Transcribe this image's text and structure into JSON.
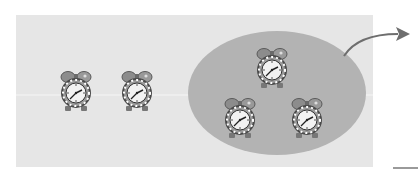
{
  "diagram": {
    "colors": {
      "panel": "#e6e6e6",
      "ellipse": "#b3b3b3",
      "arrow": "#6e6e6e",
      "clock_bell": "#8c8c8c",
      "clock_ring": "#555555",
      "clock_face": "#f2f2f2"
    },
    "clocks": [
      {
        "id": "clock-1",
        "group": "outside",
        "x": 59,
        "y": 70
      },
      {
        "id": "clock-2",
        "group": "outside",
        "x": 120,
        "y": 70
      },
      {
        "id": "clock-3",
        "group": "ellipse",
        "x": 255,
        "y": 47
      },
      {
        "id": "clock-4",
        "group": "ellipse",
        "x": 223,
        "y": 97
      },
      {
        "id": "clock-5",
        "group": "ellipse",
        "x": 290,
        "y": 97
      }
    ],
    "group_count": 3,
    "outside_count": 2
  }
}
